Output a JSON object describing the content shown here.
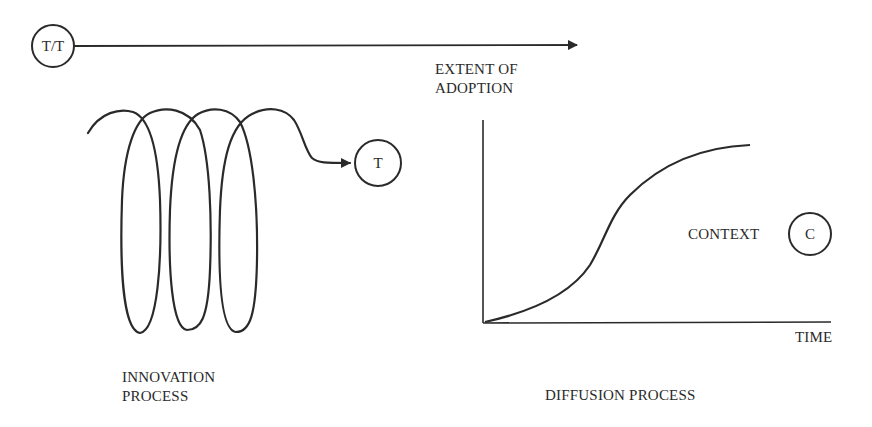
{
  "diagram": {
    "nodes": {
      "tt": {
        "label": "T/T"
      },
      "t": {
        "label": "T"
      },
      "c": {
        "label": "C"
      }
    },
    "labels": {
      "extent_of_adoption_line1": "EXTENT OF",
      "extent_of_adoption_line2": "ADOPTION",
      "time": "TIME",
      "context": "CONTEXT",
      "innovation_process_line1": "INNOVATION",
      "innovation_process_line2": "PROCESS",
      "diffusion_process": "DIFFUSION PROCESS"
    },
    "colors": {
      "stroke": "#2a2a2a",
      "background": "#ffffff"
    }
  }
}
